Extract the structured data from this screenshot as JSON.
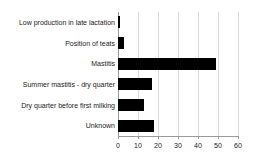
{
  "chart_data": {
    "type": "bar",
    "orientation": "horizontal",
    "title": "",
    "xlabel": "",
    "ylabel": "",
    "xlim": [
      0,
      60
    ],
    "xticks": [
      0,
      10,
      20,
      30,
      40,
      50,
      60
    ],
    "grid": true,
    "legend": false,
    "bar_color": "#000000",
    "grid_color": "#d9d9d9",
    "axis_color": "#9a9a9a",
    "categories": [
      "Low production in late lactation",
      "Position of teats",
      "Mastitis",
      "Summer mastitis - dry quarter",
      "Dry quarter before first milking",
      "Unknown"
    ],
    "values": [
      1,
      3,
      49,
      17,
      13,
      18
    ]
  }
}
